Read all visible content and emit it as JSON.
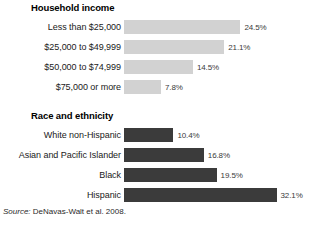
{
  "chart_data": {
    "type": "bar",
    "orientation": "horizontal",
    "title": "",
    "xlabel": "",
    "ylabel": "",
    "grid": false,
    "legend": "none",
    "value_suffix": "%",
    "xlim": [
      0,
      35
    ],
    "panels": [
      {
        "id": "income",
        "title": "Household income",
        "bar_color": "#d2d2d2",
        "categories": [
          "Less than $25,000",
          "$25,000 to $49,999",
          "$50,000 to $74,999",
          "$75,000 or more"
        ],
        "values": [
          24.5,
          21.1,
          14.5,
          7.8
        ],
        "labels": [
          "24.5%",
          "21.1%",
          "14.5%",
          "7.8%"
        ]
      },
      {
        "id": "race",
        "title": "Race and ethnicity",
        "bar_color": "#3b3b3b",
        "categories": [
          "White non-Hispanic",
          "Asian and Pacific Islander",
          "Black",
          "Hispanic"
        ],
        "values": [
          10.4,
          16.8,
          19.5,
          32.1
        ],
        "labels": [
          "10.4%",
          "16.8%",
          "19.5%",
          "32.1%"
        ]
      }
    ]
  },
  "source": {
    "prefix": "Source:",
    "text": "DeNavas-Walt et al. 2008."
  }
}
